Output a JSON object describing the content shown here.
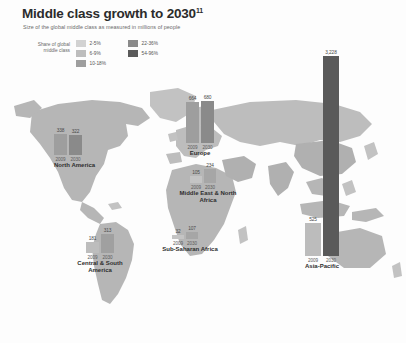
{
  "header": {
    "title": "Middle class growth to 2030",
    "title_superscript": "11",
    "subtitle": "Size of the global middle class as measured in millions of people"
  },
  "legend": {
    "title": "Share of global middle class",
    "items": [
      {
        "label": "2-5%",
        "color": "#d2d2d2"
      },
      {
        "label": "6-9%",
        "color": "#bdbdbd"
      },
      {
        "label": "10-18%",
        "color": "#9e9e9e"
      },
      {
        "label": "22-36%",
        "color": "#8a8a8a"
      },
      {
        "label": "54-96%",
        "color": "#5a5a5a"
      }
    ]
  },
  "map": {
    "ocean_color": "#ffffff",
    "land_color": "#b4b4b4",
    "land_color_light": "#c9c9c9"
  },
  "chart_data": {
    "type": "bar",
    "title": "Middle class growth to 2030",
    "subtitle": "Size of the global middle class as measured in millions of people",
    "ylabel": "Millions of people",
    "xlabel": "",
    "categories": [
      "2009",
      "2030"
    ],
    "unit": "millions of people",
    "regions": [
      {
        "name": "North America",
        "values": [
          338,
          322
        ],
        "years": [
          "2009",
          "2030"
        ],
        "bar_colors": [
          "#9e9e9e",
          "#8a8a8a"
        ]
      },
      {
        "name": "Europe",
        "values": [
          664,
          680
        ],
        "years": [
          "2009",
          "2030"
        ],
        "bar_colors": [
          "#9e9e9e",
          "#8a8a8a"
        ]
      },
      {
        "name": "Middle East & North Africa",
        "values": [
          105,
          234
        ],
        "years": [
          "2009",
          "2030"
        ],
        "bar_colors": [
          "#c4c4c4",
          "#a6a6a6"
        ]
      },
      {
        "name": "Sub-Saharan Africa",
        "values": [
          32,
          107
        ],
        "years": [
          "2009",
          "2030"
        ],
        "bar_colors": [
          "#c4c4c4",
          "#a6a6a6"
        ]
      },
      {
        "name": "Central & South America",
        "values": [
          181,
          313
        ],
        "years": [
          "2009",
          "2030"
        ],
        "bar_colors": [
          "#bdbdbd",
          "#a0a0a0"
        ]
      },
      {
        "name": "Asia-Pacific",
        "values": [
          525,
          3228
        ],
        "values_display": [
          "525",
          "3,228"
        ],
        "years": [
          "2009",
          "2030"
        ],
        "bar_colors": [
          "#bcbcbc",
          "#5a5a5a"
        ]
      }
    ]
  }
}
